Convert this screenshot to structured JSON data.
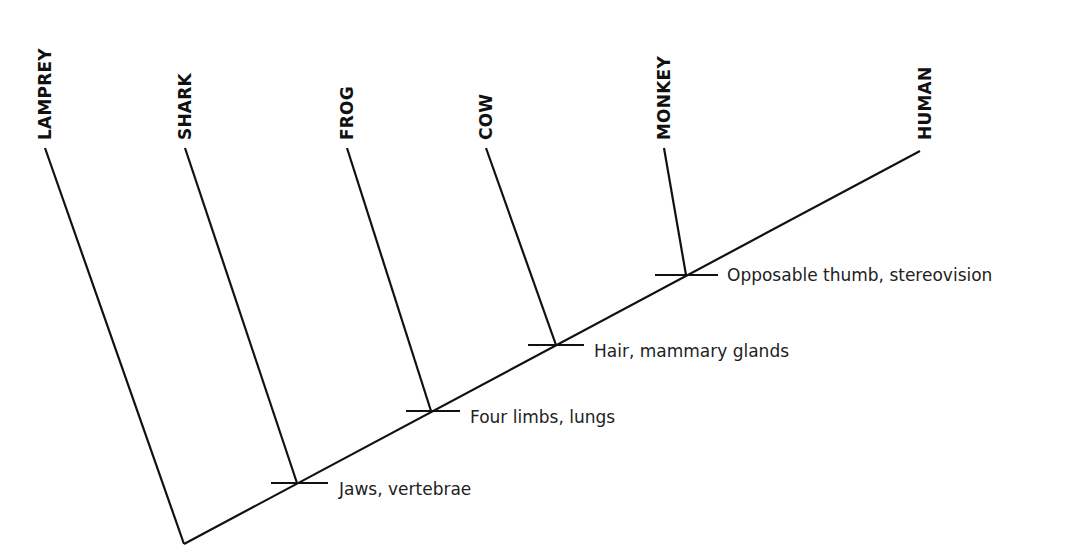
{
  "diagram": {
    "type": "cladogram",
    "root": {
      "x": 184,
      "y": 544
    },
    "main_axis_end": {
      "x": 920,
      "y": 151
    },
    "taxa": [
      {
        "name": "LAMPREY",
        "tip": {
          "x": 45,
          "y": 148
        },
        "join": {
          "x": 184,
          "y": 544
        }
      },
      {
        "name": "SHARK",
        "tip": {
          "x": 185,
          "y": 148
        },
        "join": {
          "x": 297,
          "y": 483
        }
      },
      {
        "name": "FROG",
        "tip": {
          "x": 347,
          "y": 148
        },
        "join": {
          "x": 431,
          "y": 411
        }
      },
      {
        "name": "COW",
        "tip": {
          "x": 486,
          "y": 148
        },
        "join": {
          "x": 556,
          "y": 345
        }
      },
      {
        "name": "MONKEY",
        "tip": {
          "x": 664,
          "y": 148
        },
        "join": {
          "x": 686,
          "y": 275
        }
      },
      {
        "name": "HUMAN",
        "tip": {
          "x": 920,
          "y": 151
        },
        "join": null
      }
    ],
    "traits": [
      {
        "label": "Jaws, vertebrae",
        "node": {
          "x": 299,
          "y": 483
        }
      },
      {
        "label": "Four limbs, lungs",
        "node": {
          "x": 433,
          "y": 411
        }
      },
      {
        "label": "Hair, mammary glands",
        "node": {
          "x": 557,
          "y": 345
        }
      },
      {
        "label": "Opposable thumb, stereovision",
        "node": {
          "x": 687,
          "y": 275
        }
      }
    ],
    "colors": {
      "line": "#111111",
      "text": "#222222",
      "background": "#ffffff"
    }
  }
}
